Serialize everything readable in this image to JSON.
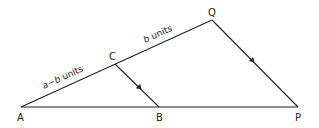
{
  "figure": {
    "points": {
      "A": {
        "label": "A"
      },
      "B": {
        "label": "B"
      },
      "C": {
        "label": "C"
      },
      "P": {
        "label": "P"
      },
      "Q": {
        "label": "Q"
      }
    },
    "segments": [
      {
        "from": "A",
        "to": "C"
      },
      {
        "from": "C",
        "to": "Q"
      },
      {
        "from": "Q",
        "to": "P"
      },
      {
        "from": "A",
        "to": "P"
      },
      {
        "from": "C",
        "to": "B"
      }
    ],
    "edge_labels": {
      "AC": {
        "var": "a−b",
        "unit": " units"
      },
      "CQ": {
        "var": "b",
        "unit": " units"
      }
    },
    "parallel_marks": [
      "CB",
      "QP"
    ],
    "colors": {
      "line": "#222222",
      "background": "#ffffff"
    }
  }
}
